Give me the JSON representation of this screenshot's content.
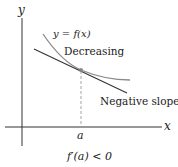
{
  "diagram": {
    "axes": {
      "x_label": "x",
      "y_label": "y"
    },
    "curve_label": "y = f(x)",
    "curve_annotation": "Decreasing",
    "tangent_annotation": "Negative slope",
    "point_label": "a",
    "caption": "f′(a) < 0",
    "colors": {
      "curve": "#8a8a8a",
      "tangent": "#333333",
      "axes": "#333333",
      "dashed": "#999999",
      "point": "#888888"
    }
  }
}
